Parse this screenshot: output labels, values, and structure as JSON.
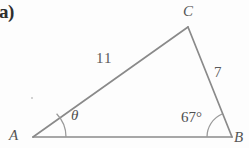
{
  "figure": {
    "part_label": "a)",
    "type": "triangle-diagram",
    "background_color": "#fdfdfd",
    "stroke_color": "#8a8a8a",
    "text_color": "#4a4a4a",
    "vertices": {
      "A": {
        "label": "A",
        "x": 33,
        "y": 137
      },
      "B": {
        "label": "B",
        "x": 232,
        "y": 137
      },
      "C": {
        "label": "C",
        "x": 188,
        "y": 27
      }
    },
    "sides": [
      {
        "name": "AC",
        "label": "11",
        "from": "A",
        "to": "C"
      },
      {
        "name": "BC",
        "label": "7",
        "from": "C",
        "to": "B"
      },
      {
        "name": "AB",
        "label": "",
        "from": "A",
        "to": "B"
      }
    ],
    "angles": [
      {
        "name": "angle-A",
        "label": "θ",
        "at": "A",
        "arc_radius": 33
      },
      {
        "name": "angle-B",
        "label": "67°",
        "at": "B",
        "arc_radius": 25
      }
    ]
  }
}
